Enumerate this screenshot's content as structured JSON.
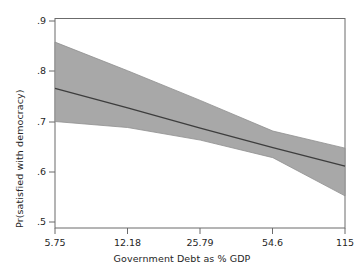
{
  "chart_data": {
    "type": "line",
    "title": "",
    "xlabel": "Government Debt as % GDP",
    "ylabel": "Pr(satisfied with democracy)",
    "xscale": "log",
    "xtick_labels": [
      "5.75",
      "12.18",
      "25.79",
      "54.6",
      "115"
    ],
    "xtick_values": [
      5.75,
      12.18,
      25.79,
      54.6,
      115
    ],
    "ytick_labels": [
      ".9",
      ".8",
      ".7",
      ".6",
      ".5"
    ],
    "ytick_values": [
      0.9,
      0.8,
      0.7,
      0.6,
      0.5
    ],
    "xlim": [
      5.75,
      115
    ],
    "ylim": [
      0.5,
      0.9
    ],
    "grid": false,
    "legend": false,
    "series": [
      {
        "name": "predicted probability",
        "kind": "fit-line",
        "x": [
          5.75,
          12.18,
          25.79,
          54.6,
          115
        ],
        "values": [
          0.766,
          0.727,
          0.687,
          0.648,
          0.611
        ]
      },
      {
        "name": "confidence interval upper",
        "kind": "band-upper",
        "x": [
          5.75,
          12.18,
          25.79,
          54.6,
          115
        ],
        "values": [
          0.858,
          0.801,
          0.742,
          0.681,
          0.647
        ]
      },
      {
        "name": "confidence interval lower",
        "kind": "band-lower",
        "x": [
          5.75,
          12.18,
          25.79,
          54.6,
          115
        ],
        "values": [
          0.7,
          0.688,
          0.663,
          0.628,
          0.552
        ]
      }
    ],
    "colors": {
      "band_fill": "#a3a3a3",
      "fit_line": "#3d3d3d",
      "axis": "#5a5a5a",
      "text": "#262626",
      "background": "#ffffff"
    }
  },
  "axes": {
    "x_title": "Government Debt as % GDP",
    "y_title": "Pr(satisfied with democracy)",
    "x_ticks": [
      {
        "label": "5.75"
      },
      {
        "label": "12.18"
      },
      {
        "label": "25.79"
      },
      {
        "label": "54.6"
      },
      {
        "label": "115"
      }
    ],
    "y_ticks": [
      {
        "label": ".9"
      },
      {
        "label": ".8"
      },
      {
        "label": ".7"
      },
      {
        "label": ".6"
      },
      {
        "label": ".5"
      }
    ]
  }
}
